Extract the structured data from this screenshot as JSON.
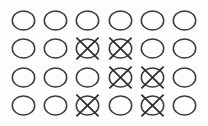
{
  "figure": {
    "name": "circle-grid",
    "rows": 4,
    "columns": 6,
    "background_color": "#fdfdfd",
    "circle_stroke_color": "#3b3b3b",
    "x_stroke_color": "#2a2a2a"
  },
  "chart_data": {
    "type": "table",
    "title": "",
    "xlabel": "",
    "ylabel": "",
    "categories": [
      "1",
      "2",
      "3",
      "4",
      "5",
      "6"
    ],
    "row_labels": [
      "1",
      "2",
      "3",
      "4"
    ],
    "legend": [
      "circle",
      "crossed-circle"
    ],
    "marked_count": 6,
    "total_count": 24,
    "series": [
      {
        "name": "row-1",
        "values": [
          0,
          0,
          0,
          0,
          0,
          0
        ]
      },
      {
        "name": "row-2",
        "values": [
          0,
          0,
          1,
          1,
          0,
          0
        ]
      },
      {
        "name": "row-3",
        "values": [
          0,
          0,
          0,
          1,
          1,
          0
        ]
      },
      {
        "name": "row-4",
        "values": [
          0,
          0,
          1,
          0,
          1,
          0
        ]
      }
    ]
  },
  "cells": [
    [
      {
        "id": "r1c1",
        "marked": false,
        "label": "circle"
      },
      {
        "id": "r1c2",
        "marked": false,
        "label": "circle"
      },
      {
        "id": "r1c3",
        "marked": false,
        "label": "circle"
      },
      {
        "id": "r1c4",
        "marked": false,
        "label": "circle"
      },
      {
        "id": "r1c5",
        "marked": false,
        "label": "circle"
      },
      {
        "id": "r1c6",
        "marked": false,
        "label": "circle"
      }
    ],
    [
      {
        "id": "r2c1",
        "marked": false,
        "label": "circle"
      },
      {
        "id": "r2c2",
        "marked": false,
        "label": "circle"
      },
      {
        "id": "r2c3",
        "marked": true,
        "label": "crossed-circle"
      },
      {
        "id": "r2c4",
        "marked": true,
        "label": "crossed-circle"
      },
      {
        "id": "r2c5",
        "marked": false,
        "label": "circle"
      },
      {
        "id": "r2c6",
        "marked": false,
        "label": "circle"
      }
    ],
    [
      {
        "id": "r3c1",
        "marked": false,
        "label": "circle"
      },
      {
        "id": "r3c2",
        "marked": false,
        "label": "circle"
      },
      {
        "id": "r3c3",
        "marked": false,
        "label": "circle"
      },
      {
        "id": "r3c4",
        "marked": true,
        "label": "crossed-circle"
      },
      {
        "id": "r3c5",
        "marked": true,
        "label": "crossed-circle"
      },
      {
        "id": "r3c6",
        "marked": false,
        "label": "circle"
      }
    ],
    [
      {
        "id": "r4c1",
        "marked": false,
        "label": "circle"
      },
      {
        "id": "r4c2",
        "marked": false,
        "label": "circle"
      },
      {
        "id": "r4c3",
        "marked": true,
        "label": "crossed-circle"
      },
      {
        "id": "r4c4",
        "marked": false,
        "label": "circle"
      },
      {
        "id": "r4c5",
        "marked": true,
        "label": "crossed-circle"
      },
      {
        "id": "r4c6",
        "marked": false,
        "label": "circle"
      }
    ]
  ]
}
